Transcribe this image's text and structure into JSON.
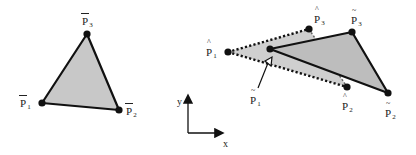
{
  "diagram": {
    "left_triangle": {
      "fill": "#c8c8c8",
      "stroke": "#111111",
      "vertices": [
        {
          "id": "P1_bar",
          "label": "P",
          "sub": "1",
          "accent": "bar",
          "x": 42,
          "y": 103
        },
        {
          "id": "P2_bar",
          "label": "P",
          "sub": "2",
          "accent": "bar",
          "x": 119,
          "y": 110
        },
        {
          "id": "P3_bar",
          "label": "P",
          "sub": "3",
          "accent": "bar",
          "x": 87,
          "y": 34
        }
      ]
    },
    "hat_triangle": {
      "fill": "#cfcfcf",
      "stroke_style": "dotted",
      "vertices": [
        {
          "id": "P1_hat",
          "label": "P",
          "sub": "1",
          "accent": "hat",
          "x": 228,
          "y": 52
        },
        {
          "id": "P2_hat",
          "label": "P",
          "sub": "2",
          "accent": "hat",
          "x": 347,
          "y": 87
        },
        {
          "id": "P3_hat",
          "label": "P",
          "sub": "3",
          "accent": "hat",
          "x": 309,
          "y": 29
        }
      ]
    },
    "tilde_triangle": {
      "fill": "#bdbdbd",
      "stroke_style": "solid",
      "vertices": [
        {
          "id": "P1_tilde",
          "label": "P",
          "sub": "1",
          "accent": "tilde",
          "x": 270,
          "y": 49
        },
        {
          "id": "P2_tilde",
          "label": "P",
          "sub": "2",
          "accent": "tilde",
          "x": 388,
          "y": 93
        },
        {
          "id": "P3_tilde",
          "label": "P",
          "sub": "3",
          "accent": "tilde",
          "x": 352,
          "y": 32
        }
      ]
    },
    "pointer": {
      "from_label": "P1_tilde",
      "text": "P",
      "sub": "1",
      "accent": "tilde"
    },
    "axes": {
      "x_label": "x",
      "y_label": "y"
    },
    "labels": {
      "p1_bar": {
        "main": "P",
        "sub": "1"
      },
      "p2_bar": {
        "main": "P",
        "sub": "2"
      },
      "p3_bar": {
        "main": "P",
        "sub": "3"
      },
      "p1_hat": {
        "main": "P",
        "sub": "1"
      },
      "p2_hat": {
        "main": "P",
        "sub": "2"
      },
      "p3_hat": {
        "main": "P",
        "sub": "3"
      },
      "p1_tilde": {
        "main": "P",
        "sub": "1"
      },
      "p2_tilde": {
        "main": "P",
        "sub": "2"
      },
      "p3_tilde": {
        "main": "P",
        "sub": "3"
      }
    }
  }
}
